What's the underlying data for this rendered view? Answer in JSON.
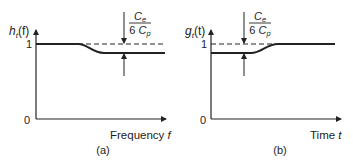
{
  "panels": [
    {
      "id": "a",
      "caption": "(a)",
      "y_label_main": "h",
      "y_label_sub": "t",
      "y_label_arg": "(f)",
      "x_label": "Frequency",
      "x_var": "f",
      "origin_label": "0",
      "level_label": "1",
      "annotation": {
        "numerator_main": "C",
        "numerator_sub": "e",
        "denominator_coef": "6",
        "denominator_main": "C",
        "denominator_sub": "p"
      },
      "curve_description": "starts at 1, drops by Ce/(6Cp) at mid frequency"
    },
    {
      "id": "b",
      "caption": "(b)",
      "y_label_main": "g",
      "y_label_sub": "t",
      "y_label_arg": "(t)",
      "x_label": "Time",
      "x_var": "t",
      "origin_label": "0",
      "level_label": "1",
      "annotation": {
        "numerator_main": "C",
        "numerator_sub": "e",
        "denominator_coef": "6",
        "denominator_main": "C",
        "denominator_sub": "p"
      },
      "curve_description": "starts below 1 by Ce/(6Cp), rises to 1 at mid time"
    }
  ],
  "colors": {
    "ink": "#222222",
    "background": "#ffffff"
  }
}
